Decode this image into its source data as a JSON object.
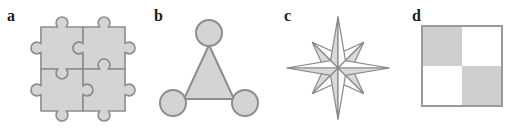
{
  "figure": {
    "panels": [
      {
        "label": "a",
        "shape": "jigsaw-puzzle-2x2"
      },
      {
        "label": "b",
        "shape": "triangle-with-corner-circles"
      },
      {
        "label": "c",
        "shape": "compass-rose-eight-point-star"
      },
      {
        "label": "d",
        "shape": "checkerboard-2x2-square"
      }
    ],
    "colors": {
      "shape_fill": "#d4d4d4",
      "shape_outline": "#8d8d8d",
      "star_shaded_half": "#d9d9d9",
      "star_light_half": "#ffffff",
      "checker_gray": "#cfcfcf",
      "checker_white": "#ffffff",
      "background": "#ffffff"
    }
  }
}
